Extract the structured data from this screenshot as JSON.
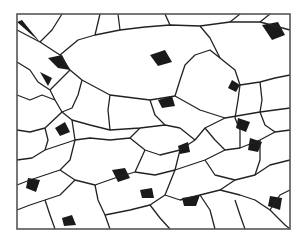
{
  "figure": {
    "frame": {
      "x": 17,
      "y": 14,
      "w": 273,
      "h": 215,
      "stroke": "#555555"
    },
    "colors": {
      "boundary": "#222222",
      "pore": "#1a1a1a",
      "background": "#ffffff"
    },
    "boundaries": [
      "17,30 40,42 60,55 70,70 82,80 110,95 150,100 175,96 200,110 225,118 260,112 290,108",
      "40,42 52,30 62,14",
      "60,55 78,40 95,35 120,30 145,27 170,25 200,26 230,22 260,22 290,30",
      "95,35 100,14",
      "120,30 118,14",
      "170,25 165,14",
      "200,26 210,38 215,48 220,58",
      "230,22 240,14",
      "260,22 270,14",
      "17,62 30,70 38,82 50,90 55,100",
      "70,70 60,80 50,90",
      "82,80 78,95 72,108 62,112",
      "55,100 62,112 72,120 90,125 110,130 140,128 165,125 180,128",
      "17,95 30,100 42,95 55,100",
      "110,95 108,110 110,130",
      "150,100 155,115 165,125",
      "175,96 180,80 185,65 195,55 210,50 220,58",
      "220,58 235,70 240,85 238,100 235,118",
      "240,85 260,82 275,78 290,75",
      "260,82 262,100 260,112",
      "17,130 30,132 45,128 62,112",
      "17,160 32,158 45,150 60,145 75,140 90,138 110,140 130,138",
      "45,128 48,140 45,150",
      "72,120 75,140",
      "130,138 140,128",
      "130,138 145,150 160,155 180,150 195,140 205,128 225,118",
      "180,128 195,140",
      "205,128 215,140 225,150 240,148 260,140 275,132 290,130",
      "235,118 240,130 240,148",
      "260,112 265,125 275,132",
      "17,185 30,180 45,175 60,170 70,160 75,140",
      "60,170 75,180 95,185 115,178 135,172 145,150",
      "135,172 155,175 175,170 190,165 205,160 225,150",
      "175,170 180,150",
      "205,160 215,175 235,180 255,175 270,165 290,160",
      "255,175 260,160 260,140",
      "17,210 30,205 45,200 60,195 75,180",
      "45,200 50,215 55,229",
      "95,185 98,200 105,215 110,229",
      "105,215 130,210 150,205 165,195 175,170",
      "165,195 180,200 200,195 220,190 235,180",
      "150,205 160,218 170,229",
      "200,195 210,210 215,229",
      "220,190 240,195 255,200 270,210 285,225 290,229",
      "270,210 280,195 290,190",
      "235,200 240,215 245,229"
    ],
    "pores": [
      "17,22 40,42 30,30 22,20",
      "48,58 62,55 70,70 58,68",
      "40,72 52,78 48,86",
      "150,55 165,50 172,62 158,66",
      "158,100 172,96 175,106 162,108",
      "232,80 240,85 236,92 228,88",
      "262,25 278,22 285,35 272,40",
      "55,128 65,122 70,132 60,136",
      "178,146 188,142 190,152 180,154",
      "238,118 250,122 246,132 236,128",
      "28,178 40,180 36,192 26,188",
      "112,170 125,168 130,178 118,182",
      "182,198 200,195 196,206 184,206",
      "250,138 262,142 258,152 248,150",
      "62,218 72,215 76,225 64,226",
      "140,190 152,188 154,198 142,198",
      "270,196 282,198 280,210 268,206"
    ]
  }
}
